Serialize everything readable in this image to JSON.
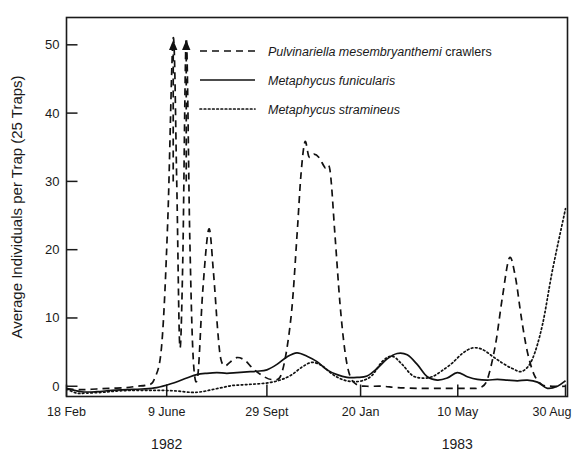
{
  "figure": {
    "background_color": "#ffffff",
    "ink_color": "#111111"
  },
  "axes": {
    "ylabel": "Average Individuals per Trap (25 Traps)",
    "y_ticks": [
      "0",
      "10",
      "20",
      "30",
      "40",
      "50"
    ],
    "x_ticks": [
      "18 Feb",
      "9 June",
      "29 Sept",
      "20 Jan",
      "10 May",
      "30 Aug"
    ],
    "year_labels": [
      "1982",
      "1983"
    ]
  },
  "legend": {
    "items": [
      {
        "style": "dashed",
        "name_italic": "Pulvinariella mesembryanthemi",
        "name_plain": " crawlers"
      },
      {
        "style": "solid",
        "name_italic": "Metaphycus funicularis",
        "name_plain": ""
      },
      {
        "style": "dotted",
        "name_italic": "Metaphycus stramineus",
        "name_plain": ""
      }
    ]
  },
  "chart_data": {
    "type": "line",
    "title": "",
    "xlabel": "",
    "ylabel": "Average Individuals per Trap (25 Traps)",
    "ylim": [
      -1.5,
      54
    ],
    "xlim": [
      0,
      100
    ],
    "grid": false,
    "legend_position": "top-right inside plot",
    "x_tick_labels": [
      "18 Feb",
      "9 June",
      "29 Sept",
      "20 Jan",
      "10 May",
      "30 Aug"
    ],
    "x_tick_positions": [
      0,
      20,
      40,
      58.7,
      78.1,
      99.6
    ],
    "y_tick_values": [
      0,
      10,
      20,
      30,
      40,
      50
    ],
    "annotations": [
      {
        "text": "arrow-up",
        "x": 21.3,
        "y": 51,
        "note": "off-scale peak, Pulvinariella crawlers"
      },
      {
        "text": "arrow-up",
        "x": 23.9,
        "y": 51,
        "note": "off-scale peak, Pulvinariella crawlers"
      },
      {
        "text": "1982",
        "x": 20,
        "y": -12
      },
      {
        "text": "1983",
        "x": 78,
        "y": -12
      }
    ],
    "series": [
      {
        "name": "Pulvinariella mesembryanthemi crawlers",
        "style": "dashed",
        "x": [
          0,
          3,
          6,
          9,
          12,
          14,
          16,
          17.5,
          19,
          20.2,
          21.3,
          22.0,
          22.6,
          23.2,
          23.9,
          24.6,
          25.3,
          26.2,
          27.2,
          28.4,
          29.3,
          30.2,
          30.8,
          31.6,
          32.6,
          34.0,
          35.6,
          37.2,
          39.0,
          41.0,
          43.0,
          44.8,
          46.0,
          46.8,
          47.6,
          48.4,
          49.4,
          50.4,
          51.6,
          52.6,
          53.6,
          54.6,
          55.6,
          56.6,
          58.0,
          60.0,
          63.0,
          66.0,
          70.0,
          74.0,
          77.0,
          79.0,
          81.0,
          82.6,
          84.0,
          85.6,
          87.0,
          88.4,
          89.6,
          90.8,
          92.0,
          93.4,
          95.0,
          97.0,
          99.6
        ],
        "y": [
          -0.4,
          -0.5,
          -0.4,
          -0.3,
          -0.2,
          0.0,
          0.2,
          1.0,
          6.0,
          24.0,
          51.0,
          30.0,
          6.0,
          18.0,
          51.0,
          22.0,
          4.0,
          1.5,
          14.0,
          23.0,
          17.0,
          8.0,
          4.0,
          3.0,
          3.5,
          4.2,
          3.8,
          2.6,
          1.6,
          1.0,
          2.0,
          10.0,
          22.0,
          31.0,
          35.8,
          33.6,
          34.0,
          33.5,
          32.0,
          31.6,
          22.0,
          12.0,
          5.0,
          1.5,
          0.2,
          0.0,
          0.0,
          -0.2,
          -0.3,
          -0.3,
          -0.3,
          -0.3,
          -0.3,
          -0.2,
          1.0,
          6.0,
          13.0,
          18.8,
          16.0,
          10.0,
          5.0,
          1.6,
          0.2,
          0.0,
          0.0
        ]
      },
      {
        "name": "Metaphycus funicularis",
        "style": "solid",
        "x": [
          0,
          3,
          6,
          9,
          12,
          15,
          18,
          21,
          24,
          26,
          28,
          30,
          32,
          34,
          36,
          38,
          40,
          42,
          44,
          46,
          48,
          50,
          52,
          54,
          56,
          58,
          60,
          62,
          64,
          66,
          68,
          70,
          72,
          74,
          76,
          78,
          80,
          82,
          84,
          86,
          88,
          90,
          92,
          94,
          96,
          98,
          99.6
        ],
        "y": [
          -0.3,
          -0.8,
          -0.8,
          -0.6,
          -0.5,
          -0.4,
          -0.2,
          0.4,
          1.2,
          1.7,
          1.9,
          2.0,
          1.9,
          2.0,
          2.1,
          2.2,
          2.4,
          3.2,
          4.3,
          4.9,
          4.4,
          3.6,
          2.4,
          1.7,
          1.3,
          1.3,
          1.5,
          2.6,
          4.0,
          4.8,
          4.6,
          3.2,
          1.4,
          0.9,
          1.2,
          2.0,
          1.4,
          1.0,
          0.9,
          1.0,
          0.9,
          0.8,
          0.9,
          0.6,
          -0.3,
          0.0,
          0.8
        ]
      },
      {
        "name": "Metaphycus stramineus",
        "style": "dotted",
        "x": [
          0,
          2,
          4,
          7,
          10,
          13,
          16,
          19,
          22,
          25,
          27,
          29,
          31,
          33,
          35,
          37,
          39,
          41,
          43,
          45,
          47,
          49,
          51,
          53,
          55,
          57,
          59,
          61,
          63,
          65,
          67,
          69,
          71,
          73,
          75,
          77,
          79,
          81,
          83,
          85,
          87,
          89,
          91,
          93,
          95,
          97,
          99.6
        ],
        "y": [
          -0.4,
          -1.0,
          -1.0,
          -0.9,
          -0.7,
          -0.6,
          -0.6,
          -0.6,
          -0.7,
          -0.9,
          -0.8,
          -0.5,
          -0.2,
          0.1,
          0.2,
          0.3,
          0.4,
          0.6,
          1.0,
          1.7,
          2.8,
          3.5,
          3.0,
          1.8,
          1.0,
          0.7,
          0.8,
          1.6,
          3.6,
          4.4,
          3.2,
          1.6,
          1.2,
          1.4,
          2.3,
          3.4,
          4.8,
          5.6,
          5.4,
          4.4,
          3.4,
          2.6,
          2.2,
          4.0,
          9.0,
          17.0,
          26.0
        ]
      }
    ]
  }
}
